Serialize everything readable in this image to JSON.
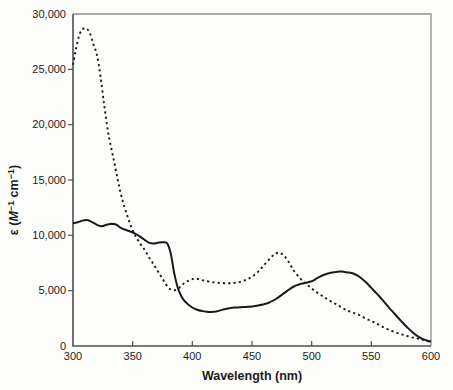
{
  "figure": {
    "background": "#fdfdfb",
    "frame_color_light": "#8e8e8e",
    "axis_color": "#4f4f4f",
    "curve_color": "#1a1a1a",
    "label_color": "#1c1c1c"
  },
  "chart_data": {
    "type": "line",
    "title": "",
    "xlabel": "Wavelength (nm)",
    "ylabel_parts": {
      "epsilon_open": "ε (",
      "m": "M",
      "sup_a": "−1",
      "cm": " cm",
      "sup_b": "−1",
      "close": ")"
    },
    "xlim": [
      300,
      600
    ],
    "ylim": [
      0,
      30000
    ],
    "grid": false,
    "legend": "none",
    "x_ticks": [
      300,
      350,
      400,
      450,
      500,
      550,
      600
    ],
    "x_tick_labels": [
      "300",
      "350",
      "400",
      "450",
      "500",
      "550",
      "600"
    ],
    "y_ticks": [
      0,
      5000,
      10000,
      15000,
      20000,
      25000,
      30000
    ],
    "y_tick_labels": [
      "0",
      "5,000",
      "10,000",
      "15,000",
      "20,000",
      "25,000",
      "30,000"
    ],
    "series": [
      {
        "name": "solid-spectrum",
        "style": "solid",
        "x": [
          300,
          304,
          308,
          312,
          316,
          320,
          324,
          328,
          332,
          336,
          340,
          344,
          348,
          352,
          356,
          360,
          364,
          368,
          372,
          376,
          379,
          382,
          385,
          388,
          391,
          394,
          397,
          400,
          404,
          408,
          412,
          416,
          420,
          425,
          430,
          435,
          440,
          445,
          450,
          455,
          460,
          465,
          470,
          475,
          480,
          485,
          490,
          495,
          500,
          505,
          510,
          515,
          520,
          525,
          530,
          535,
          540,
          545,
          550,
          555,
          560,
          565,
          570,
          575,
          580,
          585,
          590,
          595,
          600
        ],
        "y": [
          11100,
          11180,
          11330,
          11380,
          11200,
          10950,
          10820,
          10950,
          11050,
          10980,
          10680,
          10500,
          10350,
          10150,
          9900,
          9600,
          9320,
          9270,
          9350,
          9380,
          9250,
          8300,
          6500,
          5200,
          4450,
          4000,
          3700,
          3480,
          3280,
          3170,
          3100,
          3080,
          3120,
          3260,
          3400,
          3470,
          3500,
          3530,
          3560,
          3660,
          3780,
          3960,
          4250,
          4620,
          5020,
          5380,
          5580,
          5700,
          5850,
          6150,
          6420,
          6600,
          6700,
          6720,
          6650,
          6550,
          6250,
          5800,
          5250,
          4680,
          4080,
          3450,
          2850,
          2250,
          1700,
          1200,
          800,
          550,
          400
        ]
      },
      {
        "name": "dashed-spectrum",
        "style": "dashed",
        "x": [
          300,
          302,
          304,
          306,
          308,
          311,
          314,
          317,
          320,
          323,
          326,
          329,
          331,
          334,
          337,
          340,
          343,
          346,
          349,
          352,
          356,
          360,
          364,
          368,
          372,
          376,
          380,
          383,
          386,
          390,
          394,
          398,
          402,
          406,
          410,
          415,
          420,
          425,
          430,
          435,
          440,
          445,
          450,
          455,
          460,
          465,
          469,
          473,
          477,
          481,
          485,
          490,
          495,
          500,
          505,
          510,
          515,
          520,
          525,
          530,
          535,
          540,
          545,
          550,
          555,
          560,
          565,
          570,
          575,
          580,
          585,
          590,
          595,
          600
        ],
        "y": [
          25400,
          26600,
          27600,
          28300,
          28620,
          28700,
          28300,
          27300,
          26300,
          24400,
          21900,
          19600,
          18400,
          16900,
          15300,
          13800,
          12600,
          11600,
          10700,
          10000,
          9300,
          8700,
          7950,
          7300,
          6600,
          5900,
          5250,
          5100,
          5050,
          5350,
          5750,
          5950,
          6100,
          6020,
          5900,
          5800,
          5720,
          5690,
          5670,
          5700,
          5800,
          5990,
          6260,
          6700,
          7300,
          7900,
          8300,
          8420,
          8150,
          7550,
          6800,
          6150,
          5650,
          5200,
          4800,
          4450,
          4100,
          3800,
          3500,
          3200,
          3000,
          2800,
          2500,
          2250,
          2000,
          1700,
          1450,
          1250,
          1050,
          900,
          750,
          650,
          500,
          350
        ]
      }
    ]
  }
}
